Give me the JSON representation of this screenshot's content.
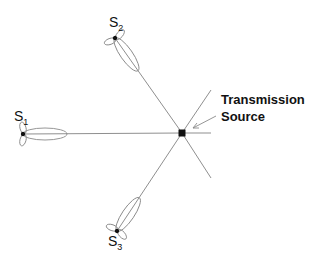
{
  "diagram": {
    "source": {
      "label_line1": "Transmission",
      "label_line2": "Source"
    },
    "stations": [
      {
        "id": "S1",
        "letter": "S",
        "subscript": "1"
      },
      {
        "id": "S2",
        "letter": "S",
        "subscript": "2"
      },
      {
        "id": "S3",
        "letter": "S",
        "subscript": "3"
      }
    ],
    "colors": {
      "line": "#8f8f8f",
      "lobe": "#8a8a8a",
      "node": "#111111",
      "text": "#111111"
    }
  }
}
